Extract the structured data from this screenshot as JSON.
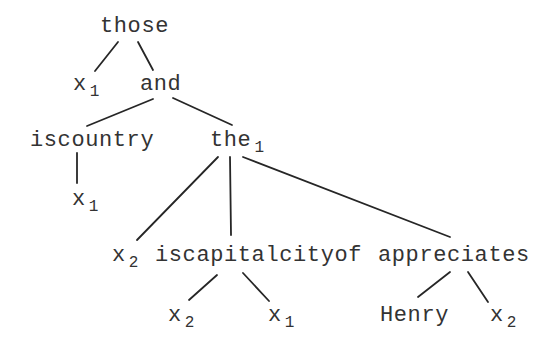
{
  "tree": {
    "nodes": [
      {
        "id": "n0",
        "label": "those",
        "subscript": ""
      },
      {
        "id": "n1",
        "label": "x",
        "subscript": "1"
      },
      {
        "id": "n2",
        "label": "and",
        "subscript": ""
      },
      {
        "id": "n3",
        "label": "iscountry",
        "subscript": ""
      },
      {
        "id": "n4",
        "label": "the",
        "subscript": "1"
      },
      {
        "id": "n5",
        "label": "x",
        "subscript": "1"
      },
      {
        "id": "n6",
        "label": "x",
        "subscript": "2"
      },
      {
        "id": "n7",
        "label": "iscapitalcityof",
        "subscript": ""
      },
      {
        "id": "n8",
        "label": "appreciates",
        "subscript": ""
      },
      {
        "id": "n9",
        "label": "x",
        "subscript": "2"
      },
      {
        "id": "n10",
        "label": "x",
        "subscript": "1"
      },
      {
        "id": "n11",
        "label": "Henry",
        "subscript": ""
      },
      {
        "id": "n12",
        "label": "x",
        "subscript": "2"
      }
    ],
    "edges": [
      [
        "n0",
        "n1"
      ],
      [
        "n0",
        "n2"
      ],
      [
        "n2",
        "n3"
      ],
      [
        "n2",
        "n4"
      ],
      [
        "n3",
        "n5"
      ],
      [
        "n4",
        "n6"
      ],
      [
        "n4",
        "n7"
      ],
      [
        "n4",
        "n8"
      ],
      [
        "n7",
        "n9"
      ],
      [
        "n7",
        "n10"
      ],
      [
        "n8",
        "n11"
      ],
      [
        "n8",
        "n12"
      ]
    ]
  },
  "colors": {
    "text": "#333333",
    "edge": "#262626",
    "background": "#ffffff"
  }
}
